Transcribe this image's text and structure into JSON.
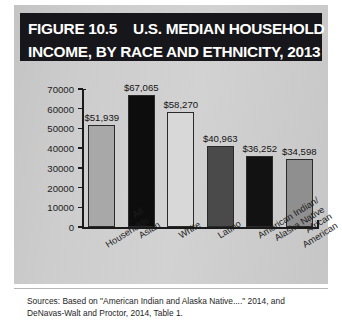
{
  "figure": {
    "title_line1_prefix": "FIGURE 10.5",
    "title_line1_main": "U.S. MEDIAN HOUSEHOLD",
    "title_line2": "INCOME, BY RACE AND ETHNICITY, 2013",
    "sources_line1": "Sources: Based on \"American Indian and Alaska Native....\" 2014, and",
    "sources_line2": "DeNavas-Walt and Proctor, 2014, Table 1."
  },
  "chart_data": {
    "type": "bar",
    "xlabel": "",
    "ylabel": "",
    "ylim": [
      0,
      70000
    ],
    "ytick_values": [
      0,
      10000,
      20000,
      30000,
      40000,
      50000,
      60000,
      70000
    ],
    "ytick_labels": [
      "0",
      "10000",
      "20000",
      "30000",
      "40000",
      "50000",
      "60000",
      "70000"
    ],
    "grid": false,
    "legend": "none",
    "categories": [
      "All\nHouseholds",
      "Asian",
      "White",
      "Latino",
      "American Indian/\nAlaska Native",
      "African\nAmerican"
    ],
    "values": [
      51939,
      67065,
      58270,
      40963,
      36252,
      34598
    ],
    "data_labels": [
      "$51,939",
      "$67,065",
      "$58,270",
      "$40,963",
      "$36,252",
      "$34,598"
    ],
    "bar_colors": [
      "#a8a8a8",
      "#0d0d0d",
      "#d8d8d8",
      "#4a4a4a",
      "#121212",
      "#8f8f8f"
    ]
  },
  "colors": {
    "panel_background": "#c9c9c9",
    "title_background": "#17161a",
    "title_text": "#ffffff",
    "axis": "#1a1a1a",
    "page_background": "#ffffff"
  }
}
